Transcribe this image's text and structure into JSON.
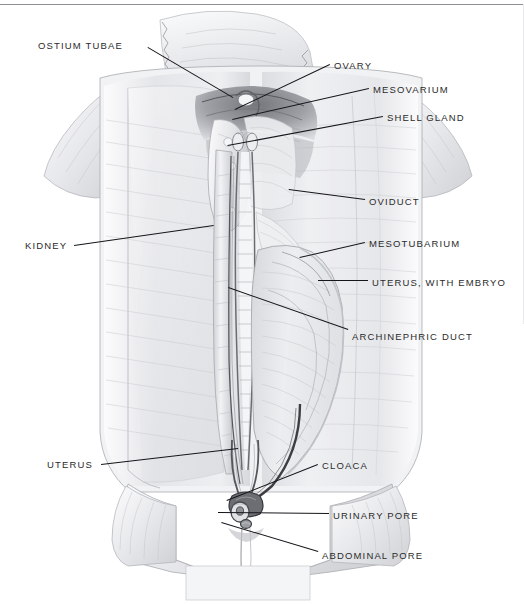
{
  "figure": {
    "background_color": "#ffffff",
    "ink_color": "#15161a",
    "tissue_color": "#e9eaec"
  },
  "labels": [
    {
      "id": "ostium-tubae",
      "text": "OSTIUM TUBAE",
      "side": "left",
      "x": 38,
      "y": 40,
      "lead_x1": 148,
      "lead_y1": 47,
      "lead_x2": 233,
      "lead_y2": 97
    },
    {
      "id": "ovary",
      "text": "OVARY",
      "side": "right",
      "x": 334,
      "y": 60,
      "lead_x1": 330,
      "lead_y1": 65,
      "lead_x2": 235,
      "lead_y2": 110
    },
    {
      "id": "mesovarium",
      "text": "MESOVARIUM",
      "side": "right",
      "x": 373,
      "y": 84,
      "lead_x1": 369,
      "lead_y1": 89,
      "lead_x2": 232,
      "lead_y2": 120
    },
    {
      "id": "shell-gland",
      "text": "SHELL GLAND",
      "side": "right",
      "x": 387,
      "y": 112,
      "lead_x1": 383,
      "lead_y1": 117,
      "lead_x2": 228,
      "lead_y2": 146
    },
    {
      "id": "oviduct",
      "text": "OVIDUCT",
      "side": "right",
      "x": 369,
      "y": 196,
      "lead_x1": 365,
      "lead_y1": 200,
      "lead_x2": 289,
      "lead_y2": 190
    },
    {
      "id": "kidney",
      "text": "KIDNEY",
      "side": "left",
      "x": 25,
      "y": 240,
      "lead_x1": 74,
      "lead_y1": 245,
      "lead_x2": 214,
      "lead_y2": 225
    },
    {
      "id": "mesotubarium",
      "text": "MESOTUBARIUM",
      "side": "right",
      "x": 369,
      "y": 238,
      "lead_x1": 365,
      "lead_y1": 243,
      "lead_x2": 300,
      "lead_y2": 258
    },
    {
      "id": "uterus-embryo",
      "text": "UTERUS, WITH EMBRYO",
      "side": "right",
      "x": 372,
      "y": 277,
      "lead_x1": 368,
      "lead_y1": 281,
      "lead_x2": 318,
      "lead_y2": 281
    },
    {
      "id": "archinephric-duct",
      "text": "ARCHINEPHRIC DUCT",
      "side": "right",
      "x": 352,
      "y": 331,
      "lead_x1": 348,
      "lead_y1": 330,
      "lead_x2": 228,
      "lead_y2": 288
    },
    {
      "id": "uterus",
      "text": "UTERUS",
      "side": "left",
      "x": 47,
      "y": 459,
      "lead_x1": 101,
      "lead_y1": 464,
      "lead_x2": 238,
      "lead_y2": 448
    },
    {
      "id": "cloaca",
      "text": "CLOACA",
      "side": "right",
      "x": 322,
      "y": 460,
      "lead_x1": 318,
      "lead_y1": 465,
      "lead_x2": 227,
      "lead_y2": 501
    },
    {
      "id": "urinary-pore",
      "text": "URINARY PORE",
      "side": "right",
      "x": 333,
      "y": 510,
      "lead_x1": 329,
      "lead_y1": 514,
      "lead_x2": 218,
      "lead_y2": 513
    },
    {
      "id": "abdominal-pore",
      "text": "ABDOMINAL PORE",
      "side": "right",
      "x": 322,
      "y": 550,
      "lead_x1": 318,
      "lead_y1": 552,
      "lead_x2": 221,
      "lead_y2": 523
    }
  ]
}
